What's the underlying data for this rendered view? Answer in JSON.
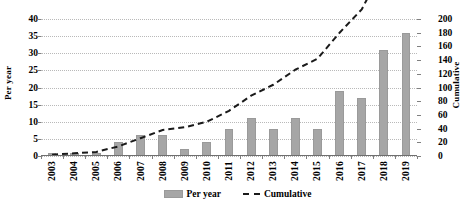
{
  "chart_data": {
    "type": "bar",
    "title": "",
    "xlabel": "",
    "categories": [
      "2003",
      "2004",
      "2005",
      "2006",
      "2007",
      "2008",
      "2009",
      "2010",
      "2011",
      "2012",
      "2013",
      "2014",
      "2015",
      "2016",
      "2017",
      "2018",
      "2019"
    ],
    "series": [
      {
        "name": "Per year",
        "type": "bar",
        "axis": "left",
        "color": "#a6a6a6",
        "values": [
          1,
          1,
          1,
          4,
          6,
          6,
          2,
          4,
          8,
          11,
          8,
          11,
          8,
          19,
          17,
          31,
          36
        ]
      },
      {
        "name": "Cumulative",
        "type": "line",
        "axis": "right",
        "color": "#1a1a1a",
        "style": "dashed",
        "values": [
          2,
          4,
          6,
          14,
          26,
          38,
          42,
          50,
          66,
          88,
          104,
          126,
          142,
          180,
          214,
          276,
          348
        ]
      }
    ],
    "left_axis": {
      "label": "Per year",
      "ticks": [
        0,
        5,
        10,
        15,
        20,
        25,
        30,
        35,
        40
      ],
      "min": 0,
      "max": 40
    },
    "right_axis": {
      "label": "Cumulative",
      "ticks": [
        0,
        20,
        40,
        60,
        80,
        100,
        120,
        140,
        160,
        180,
        200
      ],
      "min": 0,
      "max": 200
    },
    "legend": {
      "position": "bottom",
      "entries": [
        "Per year",
        "Cumulative"
      ]
    },
    "grid": true,
    "colors": {
      "bar": "#a6a6a6",
      "line": "#1a1a1a",
      "grid": "#b9b9b9",
      "axis": "#6f6f6f",
      "background": "#ffffff"
    }
  }
}
